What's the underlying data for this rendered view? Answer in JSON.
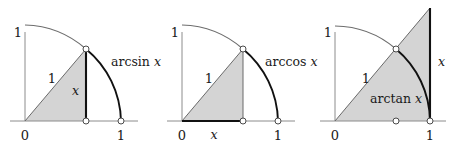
{
  "figure": {
    "background_color": "#ffffff",
    "shade_color": "#d4d4d4",
    "axis_color": "#7a7a7a",
    "arc_light_color": "#5a5a5a",
    "arc_bold_color": "#0d0d0d",
    "ink_color": "#1a1a1a",
    "node_fill": "#ffffff"
  },
  "panels": [
    {
      "id": "arcsin",
      "function_label": "arcsin",
      "function_variable": "x",
      "origin_label": "0",
      "y_top_label": "1",
      "x_right_label": "1",
      "hypotenuse_label": "1",
      "segment_label": "x",
      "segment_orientation": "vertical",
      "angle_degrees": 49.7,
      "radius": 96,
      "origin_x": 25,
      "origin_y": 121,
      "nodes": [
        {
          "name": "circle-point",
          "x": 86,
          "y": 121
        },
        {
          "name": "foot-point",
          "x": 86,
          "y": 121
        },
        {
          "name": "unit-point",
          "x": 121,
          "y": 121
        }
      ]
    },
    {
      "id": "arccos",
      "function_label": "arccos",
      "function_variable": "x",
      "origin_label": "0",
      "y_top_label": "1",
      "x_right_label": "1",
      "hypotenuse_label": "1",
      "segment_label": "x",
      "segment_orientation": "horizontal",
      "angle_degrees": 49.7,
      "radius": 96,
      "origin_x": 182,
      "origin_y": 121,
      "nodes": [
        {
          "name": "circle-point",
          "x": 243,
          "y": 49
        },
        {
          "name": "foot-point",
          "x": 243,
          "y": 121
        },
        {
          "name": "unit-point",
          "x": 278,
          "y": 121
        }
      ]
    },
    {
      "id": "arctan",
      "function_label": "arctan",
      "function_variable": "x",
      "origin_label": "0",
      "y_top_label": "1",
      "x_right_label": "1",
      "hypotenuse_label": "1",
      "segment_label": "x",
      "segment_orientation": "vertical-right",
      "angle_degrees": 49.7,
      "radius": 95,
      "origin_x": 335,
      "origin_y": 121,
      "nodes": [
        {
          "name": "circle-point",
          "x": 396,
          "y": 49
        },
        {
          "name": "mid-point",
          "x": 396,
          "y": 121
        },
        {
          "name": "unit-point",
          "x": 430,
          "y": 121
        }
      ]
    }
  ]
}
